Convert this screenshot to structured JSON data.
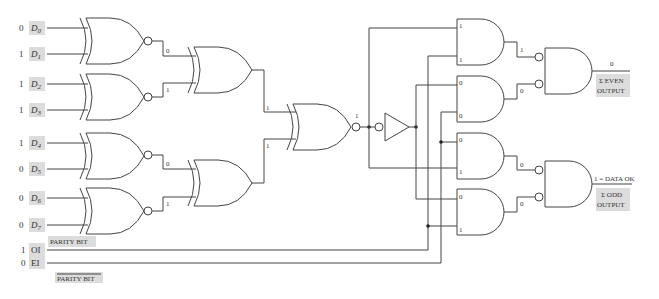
{
  "inputs": [
    {
      "name": "D0",
      "sub": "0",
      "value": "0"
    },
    {
      "name": "D1",
      "sub": "1",
      "value": "1"
    },
    {
      "name": "D2",
      "sub": "2",
      "value": "1"
    },
    {
      "name": "D3",
      "sub": "3",
      "value": "1"
    },
    {
      "name": "D4",
      "sub": "4",
      "value": "1"
    },
    {
      "name": "D5",
      "sub": "5",
      "value": "0"
    },
    {
      "name": "D6",
      "sub": "6",
      "value": "0"
    },
    {
      "name": "D7",
      "sub": "7",
      "value": "0"
    }
  ],
  "control_inputs": [
    {
      "name": "OI",
      "value": "1",
      "caption": "PARITY BIT"
    },
    {
      "name": "EI",
      "value": "0",
      "caption": "PARITY BIT",
      "overbar": true
    }
  ],
  "stage1_outputs": [
    "0",
    "1",
    "0",
    "1"
  ],
  "stage2_outputs": [
    "1",
    "1"
  ],
  "stage3_output": "1",
  "and_gate_inputs": [
    [
      "1",
      "1"
    ],
    [
      "0",
      "0"
    ],
    [
      "0",
      "1"
    ],
    [
      "0",
      "1"
    ]
  ],
  "and_gate_outputs": [
    "1",
    "0",
    "0",
    "0"
  ],
  "outputs": {
    "even": {
      "value": "0",
      "label_line1": "Σ EVEN",
      "label_line2": "OUTPUT"
    },
    "odd": {
      "value": "1 = DATA OK",
      "label_line1": "Σ ODD",
      "label_line2": "OUTPUT"
    }
  }
}
